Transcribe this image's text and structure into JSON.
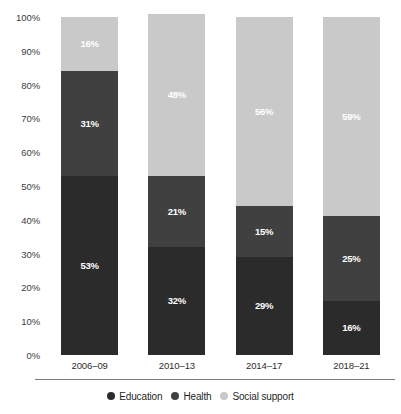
{
  "chart_data": {
    "type": "bar",
    "subtype": "stacked-bar-100-percent",
    "title": "",
    "subtitle": "",
    "xlabel": "",
    "ylabel": "",
    "categories": [
      "2006–09",
      "2010–13",
      "2014–17",
      "2018–21"
    ],
    "series": [
      {
        "name": "Education",
        "values": [
          53,
          32,
          29,
          16
        ],
        "color": "#2b2b2b"
      },
      {
        "name": "Health",
        "values": [
          31,
          21,
          15,
          25
        ],
        "color": "#404040"
      },
      {
        "name": "Social support",
        "values": [
          16,
          48,
          56,
          59
        ],
        "color": "#c9c9c9"
      }
    ],
    "stack_order": "bottom-to-top",
    "data_labels": [
      [
        "53%",
        "32%",
        "29%",
        "16%"
      ],
      [
        "31%",
        "21%",
        "15%",
        "25%"
      ],
      [
        "16%",
        "48%",
        "56%",
        "59%"
      ]
    ],
    "data_label_suffix": "%",
    "data_label_color": "#ffffff",
    "ylim": [
      0,
      100
    ],
    "ytick_values": [
      100,
      90,
      80,
      70,
      60,
      50,
      40,
      30,
      20,
      10,
      0
    ],
    "ytick_labels": [
      "100%",
      "90%",
      "80%",
      "70%",
      "60%",
      "50%",
      "40%",
      "30%",
      "20%",
      "10%",
      "0%"
    ],
    "grid": false,
    "legend_position": "bottom",
    "legend_marker": "circle",
    "legend_entries": [
      {
        "label": "Education",
        "color": "#2b2b2b"
      },
      {
        "label": "Health",
        "color": "#404040"
      },
      {
        "label": "Social support",
        "color": "#c9c9c9"
      }
    ],
    "background_color": "#ffffff",
    "axis_rule_color": "#7a7a7a"
  }
}
